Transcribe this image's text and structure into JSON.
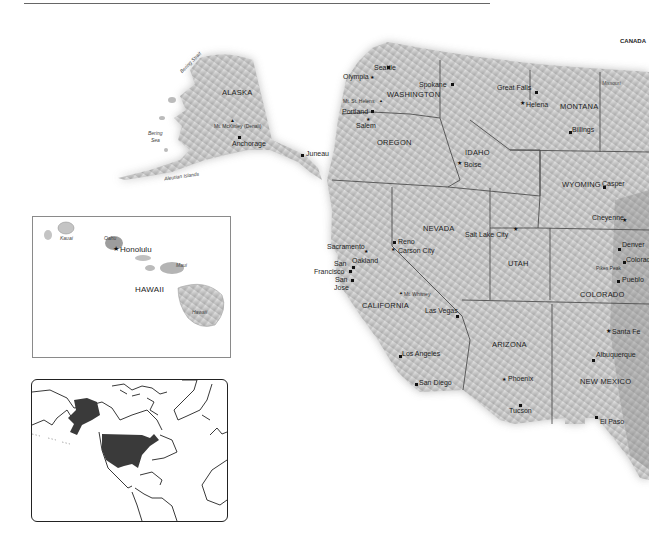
{
  "page": {
    "title_rule": true,
    "country_label": "CANADA"
  },
  "alaska": {
    "state": "ALASKA",
    "cities": [
      {
        "name": "Anchorage",
        "x": 232,
        "y": 135
      },
      {
        "name": "Juneau",
        "x": 305,
        "y": 152
      }
    ],
    "peaks": [
      {
        "name": "Mt. McKinley (Denali)",
        "x": 215,
        "y": 124
      }
    ],
    "water": [
      {
        "name": "Bering Strait",
        "x": 178,
        "y": 70,
        "rotate": -45
      },
      {
        "name": "Bering",
        "x": 148,
        "y": 131,
        "rotate": 0
      },
      {
        "name": "Sea",
        "x": 150,
        "y": 138,
        "rotate": 0
      },
      {
        "name": "Aleutian Islands",
        "x": 162,
        "y": 176,
        "rotate": -8
      }
    ]
  },
  "hawaii": {
    "state": "HAWAII",
    "capital": "Honolulu",
    "islands": [
      {
        "name": "Kauai",
        "x": 60,
        "y": 236
      },
      {
        "name": "Oahu",
        "x": 104,
        "y": 236
      },
      {
        "name": "Maui",
        "x": 175,
        "y": 263
      },
      {
        "name": "Hawaii",
        "x": 192,
        "y": 310
      }
    ]
  },
  "mainland": {
    "states": [
      {
        "name": "WASHINGTON",
        "x": 387,
        "y": 91
      },
      {
        "name": "OREGON",
        "x": 377,
        "y": 139
      },
      {
        "name": "IDAHO",
        "x": 465,
        "y": 149
      },
      {
        "name": "MONTANA",
        "x": 560,
        "y": 103
      },
      {
        "name": "WYOMING",
        "x": 562,
        "y": 181
      },
      {
        "name": "NEVADA",
        "x": 423,
        "y": 225
      },
      {
        "name": "UTAH",
        "x": 508,
        "y": 260
      },
      {
        "name": "COLORADO",
        "x": 580,
        "y": 291
      },
      {
        "name": "CALIFORNIA",
        "x": 362,
        "y": 302
      },
      {
        "name": "ARIZONA",
        "x": 492,
        "y": 341
      },
      {
        "name": "NEW MEXICO",
        "x": 580,
        "y": 378
      }
    ],
    "cities": [
      {
        "name": "Seattle",
        "x": 374,
        "y": 64,
        "capital": false,
        "dot": [
          387,
          67
        ]
      },
      {
        "name": "Olympia",
        "x": 343,
        "y": 74,
        "capital": true,
        "dot": [
          372,
          78
        ]
      },
      {
        "name": "Spokane",
        "x": 419,
        "y": 82,
        "capital": false,
        "dot": [
          451,
          83
        ]
      },
      {
        "name": "Mt. St. Helens",
        "x": 343,
        "y": 99,
        "capital": false,
        "peak": true,
        "dot": [
          381,
          101
        ]
      },
      {
        "name": "Portland",
        "x": 342,
        "y": 109,
        "capital": false,
        "dot": [
          371,
          110
        ]
      },
      {
        "name": "Salem",
        "x": 356,
        "y": 121,
        "capital": true,
        "dot": [
          368,
          119
        ]
      },
      {
        "name": "Boise",
        "x": 464,
        "y": 161,
        "capital": true,
        "dot": [
          459,
          163
        ]
      },
      {
        "name": "Great Falls",
        "x": 497,
        "y": 86,
        "capital": false,
        "dot": [
          535,
          91
        ]
      },
      {
        "name": "Helena",
        "x": 526,
        "y": 102,
        "capital": true,
        "dot": [
          522,
          103
        ]
      },
      {
        "name": "Billings",
        "x": 570,
        "y": 128,
        "capital": false,
        "dot": [
          569,
          131
        ]
      },
      {
        "name": "Missouri",
        "x": 602,
        "y": 81,
        "capital": false,
        "ital": true
      },
      {
        "name": "Casper",
        "x": 599,
        "y": 181,
        "capital": false,
        "dot": [
          603,
          186
        ]
      },
      {
        "name": "Cheyenne",
        "x": 592,
        "y": 217,
        "capital": true,
        "dot": [
          624,
          220
        ]
      },
      {
        "name": "Salt Lake City",
        "x": 465,
        "y": 231,
        "capital": true,
        "dot": [
          516,
          229
        ]
      },
      {
        "name": "Reno",
        "x": 398,
        "y": 240,
        "capital": false,
        "dot": [
          393,
          243
        ]
      },
      {
        "name": "Carson City",
        "x": 398,
        "y": 248,
        "capital": true,
        "dot": [
          393,
          251
        ]
      },
      {
        "name": "Sacramento",
        "x": 327,
        "y": 244,
        "capital": true,
        "dot": [
          366,
          252
        ]
      },
      {
        "name": "Oakland",
        "x": 352,
        "y": 258,
        "capital": false,
        "dot": [
          352,
          266
        ]
      },
      {
        "name": "San",
        "x": 334,
        "y": 260,
        "capital": false
      },
      {
        "name": "Francisco",
        "x": 314,
        "y": 268,
        "capital": false,
        "dot": [
          349,
          270
        ]
      },
      {
        "name": "San",
        "x": 335,
        "y": 276,
        "capital": false
      },
      {
        "name": "Jose",
        "x": 334,
        "y": 284,
        "capital": false,
        "dot": [
          351,
          279
        ]
      },
      {
        "name": "Mt. Whitney",
        "x": 402,
        "y": 292,
        "capital": false,
        "peak": true,
        "dot": [
          401,
          294
        ]
      },
      {
        "name": "Las Vegas",
        "x": 425,
        "y": 307,
        "capital": false,
        "dot": [
          456,
          315
        ]
      },
      {
        "name": "Denver",
        "x": 621,
        "y": 243,
        "capital": true,
        "dot": [
          620,
          248
        ]
      },
      {
        "name": "Colorado Springs",
        "x": 626,
        "y": 256,
        "capital": false,
        "dot": [
          624,
          261
        ]
      },
      {
        "name": "Pueblo",
        "x": 622,
        "y": 278,
        "capital": false,
        "dot": [
          618,
          281
        ]
      },
      {
        "name": "Pikes Peak",
        "x": 596,
        "y": 266,
        "capital": false,
        "peak": true
      },
      {
        "name": "Santa Fe",
        "x": 612,
        "y": 329,
        "capital": true,
        "dot": [
          608,
          331
        ]
      },
      {
        "name": "Albuquerque",
        "x": 596,
        "y": 351,
        "capital": false,
        "dot": [
          593,
          359
        ]
      },
      {
        "name": "El Paso",
        "x": 597,
        "y": 418,
        "capital": false,
        "dot": [
          595,
          418
        ]
      },
      {
        "name": "Los Angeles",
        "x": 401,
        "y": 350,
        "capital": false,
        "dot": [
          399,
          355
        ]
      },
      {
        "name": "San Diego",
        "x": 418,
        "y": 380,
        "capital": false,
        "dot": [
          416,
          384
        ]
      },
      {
        "name": "Phoenix",
        "x": 507,
        "y": 375,
        "capital": true,
        "dot": [
          504,
          380
        ]
      },
      {
        "name": "Tucson",
        "x": 509,
        "y": 407,
        "capital": false,
        "dot": [
          520,
          405
        ]
      }
    ]
  },
  "locator": {
    "highlight_color": "#3a3a3a",
    "highlighted": [
      "Alaska",
      "Contiguous United States",
      "Hawaii"
    ]
  },
  "colors": {
    "land_light": "#e6e6e6",
    "land_mid": "#bdbdbd",
    "land_dark": "#8c8c8c",
    "border": "#555555",
    "rule": "#666666"
  }
}
